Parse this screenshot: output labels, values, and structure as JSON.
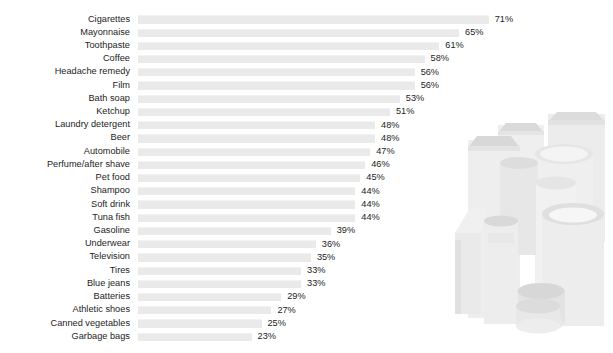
{
  "chart_data": {
    "type": "bar",
    "orientation": "horizontal",
    "title": "",
    "subtitle": "",
    "xlabel": "",
    "ylabel": "",
    "xlim": [
      0,
      100
    ],
    "grid": false,
    "legend": null,
    "value_suffix": "%",
    "value_labels_shown": true,
    "axis_ticks_shown": false,
    "sort": "descending",
    "categories": [
      "Cigarettes",
      "Mayonnaise",
      "Toothpaste",
      "Coffee",
      "Headache remedy",
      "Film",
      "Bath soap",
      "Ketchup",
      "Laundry detergent",
      "Beer",
      "Automobile",
      "Perfume/after shave",
      "Pet food",
      "Shampoo",
      "Soft drink",
      "Tuna fish",
      "Gasoline",
      "Underwear",
      "Television",
      "Tires",
      "Blue jeans",
      "Batteries",
      "Athletic shoes",
      "Canned vegetables",
      "Garbage bags"
    ],
    "values": [
      71,
      65,
      61,
      58,
      56,
      56,
      53,
      51,
      48,
      48,
      47,
      46,
      45,
      44,
      44,
      44,
      39,
      36,
      35,
      33,
      33,
      29,
      27,
      25,
      23
    ],
    "value_text": [
      "71%",
      "65%",
      "61%",
      "58%",
      "56%",
      "56%",
      "53%",
      "51%",
      "48%",
      "48%",
      "47%",
      "46%",
      "45%",
      "44%",
      "44%",
      "44%",
      "39%",
      "36%",
      "35%",
      "33%",
      "33%",
      "29%",
      "27%",
      "25%",
      "23%"
    ]
  },
  "style": {
    "bar_color": "#eaeaea",
    "bar_highlight": "#f3f3f3",
    "text_color": "#1c1c1c",
    "background": "#ffffff",
    "artwork_fill_light": "#f2f2f2",
    "artwork_fill_mid": "#e4e4e4",
    "artwork_fill_dark": "#d6d6d6"
  },
  "decor": {
    "name": "product-containers-illustration",
    "description": "cluster of cylindrical jars and boxes"
  }
}
